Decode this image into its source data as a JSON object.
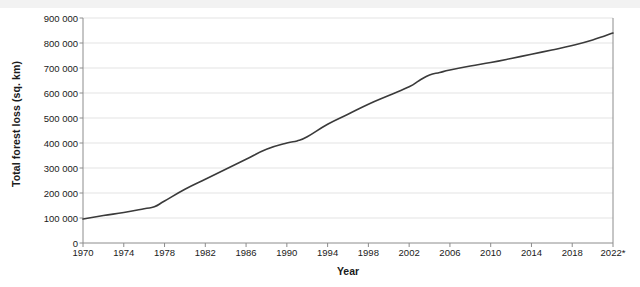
{
  "chart_data": {
    "type": "line",
    "title": "",
    "xlabel": "Year",
    "ylabel": "Total forest loss (sq. km)",
    "xlim": [
      1970,
      2022
    ],
    "ylim": [
      0,
      900000
    ],
    "grid": "horizontal",
    "legend": "none",
    "line_color": "#3a3a3a",
    "grid_color": "#e3e3e3",
    "axis_color": "#8c8c8c",
    "y_ticks": [
      "0",
      "100 000",
      "200 000",
      "300 000",
      "400 000",
      "500 000",
      "600 000",
      "700 000",
      "800 000",
      "900 000"
    ],
    "y_tick_values": [
      0,
      100000,
      200000,
      300000,
      400000,
      500000,
      600000,
      700000,
      800000,
      900000
    ],
    "x_ticks": [
      "1970",
      "1974",
      "1978",
      "1982",
      "1986",
      "1990",
      "1994",
      "1998",
      "2002",
      "2006",
      "2010",
      "2014",
      "2018",
      "2022*"
    ],
    "x_tick_values": [
      1970,
      1974,
      1978,
      1982,
      1986,
      1990,
      1994,
      1998,
      2002,
      2006,
      2010,
      2014,
      2018,
      2022
    ],
    "x": [
      1970,
      1972,
      1974,
      1976,
      1977,
      1978,
      1980,
      1982,
      1984,
      1986,
      1988,
      1990,
      1991,
      1992,
      1994,
      1996,
      1998,
      2000,
      2002,
      2003,
      2004,
      2005,
      2006,
      2008,
      2010,
      2012,
      2014,
      2016,
      2018,
      2020,
      2022
    ],
    "values": [
      96000,
      110000,
      122000,
      137000,
      145000,
      168000,
      215000,
      255000,
      295000,
      335000,
      375000,
      400000,
      408000,
      425000,
      475000,
      515000,
      555000,
      590000,
      625000,
      650000,
      672000,
      682000,
      692000,
      708000,
      722000,
      738000,
      755000,
      772000,
      790000,
      812000,
      840000
    ],
    "series": [
      {
        "name": "Total forest loss",
        "values": [
          96000,
          110000,
          122000,
          137000,
          145000,
          168000,
          215000,
          255000,
          295000,
          335000,
          375000,
          400000,
          408000,
          425000,
          475000,
          515000,
          555000,
          590000,
          625000,
          650000,
          672000,
          682000,
          692000,
          708000,
          722000,
          738000,
          755000,
          772000,
          790000,
          812000,
          840000
        ]
      }
    ],
    "annotations": [
      "2022*"
    ]
  }
}
